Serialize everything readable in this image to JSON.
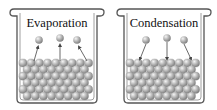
{
  "panels": [
    {
      "title": "Evaporation",
      "arrow_direction": "up"
    },
    {
      "title": "Condensation",
      "arrow_direction": "down"
    }
  ],
  "colors": {
    "outline": "#555555",
    "sphere": "#b8b8b8",
    "sphere_highlight": "#f2f2f2",
    "sphere_shadow": "#7a7a7a",
    "background": "#ffffff"
  }
}
